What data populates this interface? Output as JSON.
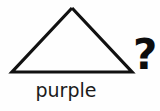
{
  "canvas": {
    "width": 160,
    "height": 111,
    "background_color": "#fefefe"
  },
  "figure": {
    "shape_name": "triangle",
    "shape_icon": "triangle-outline-icon",
    "stroke_color": "#111111",
    "fill": "none",
    "stroke_width": 3.2,
    "points": "72,8 132,72 12,72 72,8"
  },
  "caption": {
    "text": "purple",
    "color": "#1a1a1a"
  },
  "prompt": {
    "question_mark": "?",
    "color": "#0d0d0d"
  }
}
